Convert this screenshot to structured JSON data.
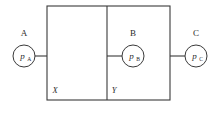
{
  "figure": {
    "type": "two-chamber-vessel-pressure-diagram",
    "background_color": "#ffffff",
    "line_color": "#3a3a3a",
    "text_color": "#2b2b2b"
  },
  "vessel": {
    "outer_rect": {
      "x": 47,
      "y": 6,
      "width": 123,
      "height": 94
    },
    "partition": {
      "x": 107,
      "y_top": 6,
      "y_bottom": 100
    }
  },
  "regions": [
    {
      "id": "X",
      "label": "X",
      "label_x": 55,
      "label_y": 93
    },
    {
      "id": "Y",
      "label": "Y",
      "label_x": 114,
      "label_y": 93
    }
  ],
  "gauges": [
    {
      "id": "A",
      "node_label": "A",
      "symbol": "p",
      "subscript": "A",
      "cx": 24,
      "cy": 56,
      "r": 11,
      "label_x": 24,
      "label_y": 36,
      "connector": {
        "x1": 35,
        "y1": 56,
        "x2": 47,
        "y2": 56
      }
    },
    {
      "id": "B",
      "node_label": "B",
      "symbol": "p",
      "subscript": "B",
      "cx": 133,
      "cy": 56,
      "r": 11,
      "label_x": 133,
      "label_y": 36,
      "connector": {
        "x1": 107,
        "y1": 56,
        "x2": 122,
        "y2": 56
      }
    },
    {
      "id": "C",
      "node_label": "C",
      "symbol": "p",
      "subscript": "C",
      "cx": 196,
      "cy": 56,
      "r": 11,
      "label_x": 196,
      "label_y": 36,
      "connector": {
        "x1": 170,
        "y1": 56,
        "x2": 185,
        "y2": 56
      }
    }
  ]
}
